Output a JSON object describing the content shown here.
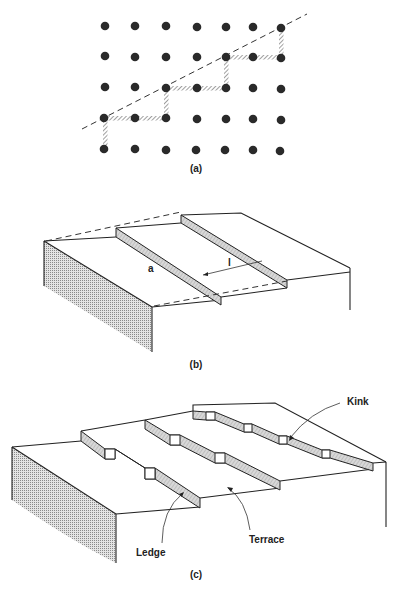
{
  "figure": {
    "panels": [
      {
        "id": "a",
        "caption": "(a)",
        "description": "Square lattice of atoms with dashed line cutting diagonally; hatched bonds trace staircase of steps"
      },
      {
        "id": "b",
        "caption": "(b)",
        "description": "Vicinal surface with straight monatomic steps",
        "labels": {
          "step_height": "a",
          "terrace_width": "l"
        }
      },
      {
        "id": "c",
        "caption": "(c)",
        "description": "Stepped surface with kinks along ledges",
        "labels": {
          "kink": "Kink",
          "ledge": "Ledge",
          "terrace": "Terrace"
        }
      }
    ],
    "lattice": {
      "columns": 7,
      "rows": 5,
      "x": [
        105,
        135,
        166,
        197,
        226,
        253,
        281
      ],
      "y": [
        26,
        57,
        88,
        118,
        150
      ]
    },
    "colors": {
      "ink": "#222222",
      "hatch": "#9a9a9a",
      "background": "#ffffff"
    }
  }
}
